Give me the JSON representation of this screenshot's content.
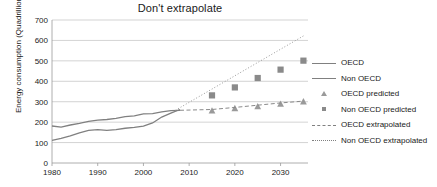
{
  "chart_data": {
    "type": "line",
    "title": "Don't extrapolate",
    "xlabel": "",
    "ylabel": "Energy consumption (Quadrillion Btu)",
    "xlim": [
      1980,
      2036
    ],
    "ylim": [
      0,
      700
    ],
    "ytick_labels": [
      "0",
      "100",
      "200",
      "300",
      "400",
      "500",
      "600",
      "700"
    ],
    "ytick_values": [
      0,
      100,
      200,
      300,
      400,
      500,
      600,
      700
    ],
    "xtick_labels": [
      "1980",
      "1990",
      "2000",
      "2010",
      "2020",
      "2030"
    ],
    "xtick_values": [
      1980,
      1990,
      2000,
      2010,
      2020,
      2030
    ],
    "grid": "horizontal",
    "legend_position": "right",
    "legend": [
      "OECD",
      "Non OECD",
      "OECD predicted",
      "Non OECD predicted",
      "OECD extrapolated",
      "Non OECD extrapolated"
    ],
    "series": [
      {
        "name": "OECD",
        "style": "solid-line",
        "color": "#808080",
        "x": [
          1980,
          1982,
          1984,
          1986,
          1988,
          1990,
          1992,
          1994,
          1996,
          1998,
          2000,
          2002,
          2004,
          2006,
          2008
        ],
        "values": [
          181,
          176,
          186,
          194,
          204,
          210,
          213,
          218,
          227,
          231,
          240,
          242,
          250,
          256,
          258
        ]
      },
      {
        "name": "Non OECD",
        "style": "solid-line",
        "color": "#808080",
        "x": [
          1980,
          1982,
          1984,
          1986,
          1988,
          1990,
          1992,
          1994,
          1996,
          1998,
          2000,
          2002,
          2004,
          2006,
          2008
        ],
        "values": [
          111,
          120,
          133,
          148,
          160,
          163,
          160,
          163,
          170,
          174,
          180,
          196,
          225,
          244,
          262
        ]
      },
      {
        "name": "OECD predicted",
        "style": "triangle-markers",
        "color": "#9a9a9a",
        "x": [
          2015,
          2020,
          2025,
          2030,
          2035
        ],
        "values": [
          256,
          268,
          277,
          289,
          301
        ]
      },
      {
        "name": "Non OECD predicted",
        "style": "square-markers",
        "color": "#8a8a8a",
        "x": [
          2015,
          2020,
          2025,
          2030,
          2035
        ],
        "values": [
          331,
          370,
          416,
          457,
          501
        ]
      },
      {
        "name": "OECD extrapolated",
        "style": "dashed-line",
        "color": "#8a8a8a",
        "x": [
          2008,
          2015,
          2020,
          2025,
          2030,
          2035
        ],
        "values": [
          258,
          262,
          272,
          283,
          294,
          303
        ]
      },
      {
        "name": "Non OECD extrapolated",
        "style": "dotted-line",
        "color": "#9a9a9a",
        "x": [
          2007,
          2035
        ],
        "values": [
          258,
          622
        ]
      }
    ]
  }
}
